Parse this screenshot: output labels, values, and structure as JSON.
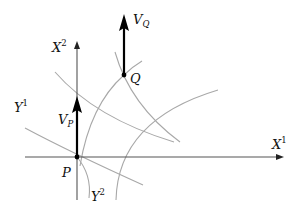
{
  "diagram": {
    "type": "coordinate-curves-with-tangent-vectors",
    "axes": {
      "horizontal": {
        "base": "X",
        "index": "1"
      },
      "vertical": {
        "base": "X",
        "index": "2"
      }
    },
    "curve_families": [
      {
        "base": "Y",
        "index": "1"
      },
      {
        "base": "Y",
        "index": "2"
      }
    ],
    "points": [
      {
        "id": "P",
        "label": "P"
      },
      {
        "id": "Q",
        "label": "Q"
      }
    ],
    "vectors": [
      {
        "base": "V",
        "subscript": "P",
        "at": "P"
      },
      {
        "base": "V",
        "subscript": "Q",
        "at": "Q"
      }
    ],
    "colors": {
      "curves": "#a8a8a8",
      "axes": "#555555",
      "vectors": "#000000",
      "background": "#ffffff"
    }
  }
}
